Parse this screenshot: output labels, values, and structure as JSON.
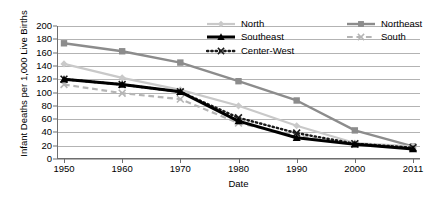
{
  "chart_data": {
    "type": "line",
    "title": "",
    "xlabel": "Date",
    "ylabel": "Infant Deaths per 1,000 Live Births",
    "categories": [
      "1950",
      "1960",
      "1970",
      "1980",
      "1990",
      "2000",
      "2011"
    ],
    "x": [
      1950,
      1960,
      1970,
      1980,
      1990,
      2000,
      2011
    ],
    "ylim": [
      0,
      200
    ],
    "yticks": [
      0,
      20,
      40,
      60,
      80,
      100,
      120,
      140,
      160,
      180,
      200
    ],
    "grid": true,
    "legend_position": "top-right-inside",
    "series": [
      {
        "name": "North",
        "values": [
          143,
          122,
          104,
          80,
          50,
          24,
          19
        ],
        "color": "#c9c9c9",
        "style": "solid",
        "marker": "diamond",
        "width": 2.2
      },
      {
        "name": "Northeast",
        "values": [
          174,
          162,
          145,
          117,
          88,
          43,
          19
        ],
        "color": "#8c8c8c",
        "style": "solid",
        "marker": "square",
        "width": 2.4
      },
      {
        "name": "Southeast",
        "values": [
          120,
          112,
          101,
          57,
          32,
          22,
          15
        ],
        "color": "#000000",
        "style": "solid",
        "marker": "triangle",
        "width": 3.0
      },
      {
        "name": "South",
        "values": [
          112,
          99,
          90,
          54,
          35,
          22,
          16
        ],
        "color": "#b5b5b5",
        "style": "dashed",
        "marker": "x",
        "width": 2.2
      },
      {
        "name": "Center-West",
        "values": [
          120,
          112,
          101,
          62,
          39,
          23,
          17
        ],
        "color": "#1a1a1a",
        "style": "dotted",
        "marker": "x",
        "width": 2.4
      }
    ]
  },
  "axis": {
    "y_title": "Infant Deaths per 1,000 Live Births",
    "x_title": "Date"
  },
  "legend": {
    "items": [
      {
        "label": "North"
      },
      {
        "label": "Northeast"
      },
      {
        "label": "Southeast"
      },
      {
        "label": "South"
      },
      {
        "label": "Center-West"
      }
    ]
  }
}
